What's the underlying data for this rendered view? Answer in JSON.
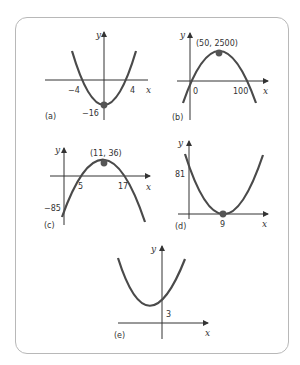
{
  "figure": {
    "panels": [
      {
        "id": "a",
        "label": "(a)",
        "axis_x": "x",
        "axis_y": "y",
        "ticks_x": [
          "−4",
          "4"
        ],
        "ticks_y": [
          "−16"
        ],
        "vertex_label": "",
        "opens": "up"
      },
      {
        "id": "b",
        "label": "(b)",
        "axis_x": "x",
        "axis_y": "y",
        "ticks_x": [
          "0",
          "100"
        ],
        "ticks_y": [],
        "vertex_label": "(50, 2500)",
        "opens": "down"
      },
      {
        "id": "c",
        "label": "(c)",
        "axis_x": "x",
        "axis_y": "y",
        "ticks_x": [
          "5",
          "17"
        ],
        "ticks_y": [
          "−85"
        ],
        "vertex_label": "(11, 36)",
        "opens": "down"
      },
      {
        "id": "d",
        "label": "(d)",
        "axis_x": "x",
        "axis_y": "y",
        "ticks_x": [
          "9"
        ],
        "ticks_y": [
          "81"
        ],
        "vertex_label": "",
        "opens": "up"
      },
      {
        "id": "e",
        "label": "(e)",
        "axis_x": "x",
        "axis_y": "y",
        "ticks_x": [],
        "ticks_y": [
          "3"
        ],
        "vertex_label": "",
        "opens": "up"
      }
    ]
  },
  "colors": {
    "border": "#b8b8b8",
    "curve": "#4a4a4a",
    "axis": "#333333",
    "point": "#555555"
  }
}
